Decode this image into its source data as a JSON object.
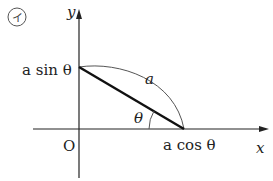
{
  "figure": {
    "marker": "イ",
    "axes": {
      "x_label": "x",
      "y_label": "y",
      "origin_label": "O"
    },
    "points": {
      "y_intercept_label": "a sin θ",
      "x_intercept_label": "a cos θ"
    },
    "segment": {
      "length_label": "a"
    },
    "angle": {
      "label": "θ"
    },
    "colors": {
      "axis": "#222222",
      "segment": "#111111",
      "arc": "#555555"
    }
  }
}
